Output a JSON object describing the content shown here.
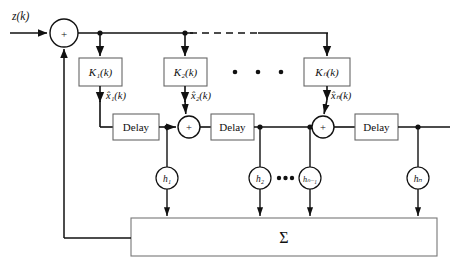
{
  "figure": {
    "type": "block-diagram",
    "background_color": "#ffffff",
    "line_color": "#111111",
    "box_stroke_color": "#555555",
    "circle_stroke_color": "#111111"
  },
  "signals": {
    "input_label": "z(k)",
    "state_estimates": [
      {
        "name": "x1hat",
        "label": "x̂₁(k)"
      },
      {
        "name": "x2hat",
        "label": "x̂₂(k)"
      },
      {
        "name": "xNhat",
        "label": "x̂ₙ(k)"
      }
    ]
  },
  "gain_blocks": [
    {
      "name": "gain-k1",
      "label": "K₁(k)"
    },
    {
      "name": "gain-k2",
      "label": "K₂(k)"
    },
    {
      "name": "gain-kn",
      "label": "Kₙ(k)"
    }
  ],
  "delay_blocks": [
    {
      "name": "delay-1",
      "label": "Delay"
    },
    {
      "name": "delay-2",
      "label": "Delay"
    },
    {
      "name": "delay-3",
      "label": "Delay"
    }
  ],
  "adders": [
    {
      "name": "adder-input",
      "label": "+"
    },
    {
      "name": "adder-1",
      "label": "+"
    },
    {
      "name": "adder-2",
      "label": "+"
    }
  ],
  "tap_weights": [
    {
      "name": "tap-h1",
      "label": "h₁"
    },
    {
      "name": "tap-h2",
      "label": "h₂"
    },
    {
      "name": "tap-hn-1",
      "label": "hₙ₋₁"
    },
    {
      "name": "tap-hn",
      "label": "hₙ"
    }
  ],
  "summation_block": {
    "name": "summation",
    "label": "Σ"
  },
  "ellipses": {
    "gain_row_dots": "•  •  •",
    "tap_row_dots": "•••",
    "bus_dashed": "dashed"
  }
}
